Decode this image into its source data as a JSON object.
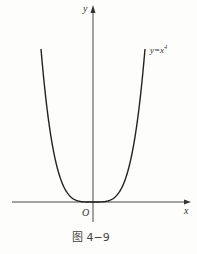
{
  "chart_data": {
    "type": "line",
    "title": "",
    "caption": "图 4−9",
    "xlabel": "x",
    "ylabel": "y",
    "origin_label": "O",
    "series": [
      {
        "name": "y=x^4",
        "label": "y=x⁴",
        "function": "x^4",
        "x": [
          -1.0,
          -0.75,
          -0.5,
          -0.25,
          0,
          0.25,
          0.5,
          0.75,
          1.0
        ],
        "values": [
          1.0,
          0.316,
          0.0625,
          0.0039,
          0,
          0.0039,
          0.0625,
          0.316,
          1.0
        ]
      }
    ],
    "grid": false,
    "legend": "inline label near right branch",
    "xlim": [
      -1.5,
      1.8
    ],
    "ylim": [
      -0.1,
      1.3
    ]
  },
  "labels": {
    "y_axis": "y",
    "x_axis": "x",
    "origin": "O",
    "curve_base": "y=x",
    "curve_exp": "4",
    "caption": "图 4−9"
  }
}
